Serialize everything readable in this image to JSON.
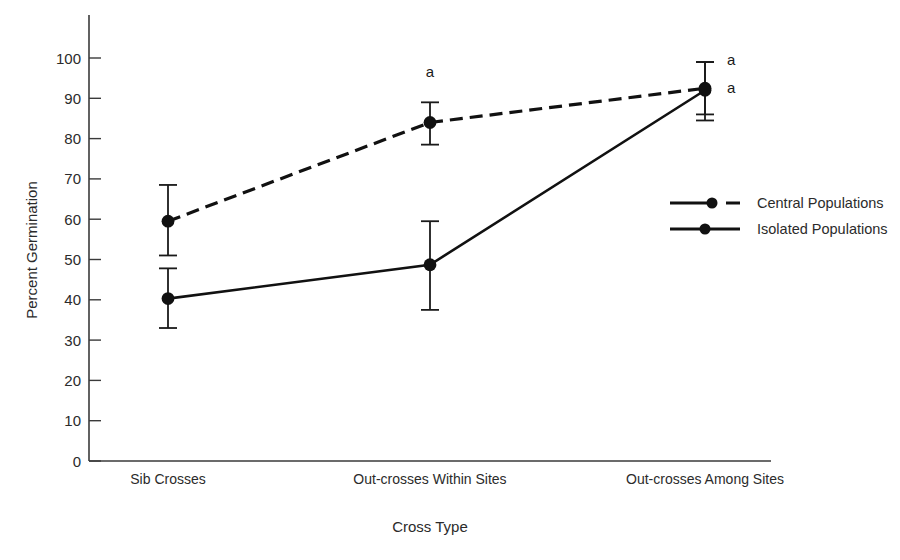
{
  "chart_data": {
    "type": "line",
    "title": "",
    "xlabel": "Cross Type",
    "ylabel": "Percent Germination",
    "categories": [
      "Sib Crosses",
      "Out-crosses Within Sites",
      "Out-crosses Among Sites"
    ],
    "ylim": [
      0,
      100
    ],
    "yticks": [
      0,
      10,
      20,
      30,
      40,
      50,
      60,
      70,
      80,
      90,
      100
    ],
    "ytick_labels": [
      "0",
      "10",
      "20",
      "30",
      "40",
      "50",
      "60",
      "70",
      "80",
      "90",
      "100"
    ],
    "grid": false,
    "legend_position": "right-middle",
    "series": [
      {
        "name": "Central Populations",
        "style": "dashed",
        "marker": "filled-circle",
        "values": [
          59.5,
          84.0,
          92.5
        ],
        "error_upper": [
          68.5,
          89.0,
          99.0
        ],
        "error_lower": [
          51.0,
          78.5,
          86.0
        ]
      },
      {
        "name": "Isolated Populations",
        "style": "solid",
        "marker": "filled-circle",
        "values": [
          40.3,
          48.7,
          92.0
        ],
        "error_upper": [
          47.8,
          59.5,
          99.0
        ],
        "error_lower": [
          33.0,
          37.5,
          84.5
        ]
      }
    ],
    "annotations": [
      {
        "text": "a",
        "category": "Out-crosses Within Sites",
        "value": 96.5,
        "series": "Central Populations"
      },
      {
        "text": "a",
        "category": "Out-crosses Among Sites",
        "value": 99.5,
        "series": "Central Populations"
      },
      {
        "text": "a",
        "category": "Out-crosses Among Sites",
        "value": 92.5,
        "series": "Isolated Populations"
      }
    ]
  },
  "legend": {
    "entries": [
      {
        "label": "Central Populations",
        "style": "dashed"
      },
      {
        "label": "Isolated Populations",
        "style": "solid"
      }
    ]
  },
  "axes": {
    "y_title": "Percent Germination",
    "x_title": "Cross Type"
  }
}
